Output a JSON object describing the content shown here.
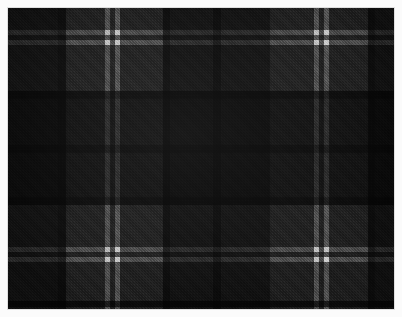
{
  "swatch": {
    "title": "Tartan fabric swatch",
    "description": "Grayscale tartan / plaid woven cloth with twill weave texture",
    "width": 402,
    "height": 317,
    "background_color": "#fbfbfb",
    "border_color": "#e8e8e8",
    "cloth": {
      "x": 8,
      "y": 8,
      "width": 386,
      "height": 301,
      "base_color": "#4a4a4a"
    },
    "palette": {
      "white": "#e9e9e9",
      "light_gray": "#c9c9c9",
      "mid_gray": "#595959",
      "gray": "#4d4d4d",
      "dark_gray": "#343434",
      "charcoal": "#202020",
      "near_black": "#0a0a0a",
      "black": "#000000"
    },
    "weave": {
      "type": "twill",
      "angle_deg": 45,
      "thread_px": 2
    },
    "warp_stripes": [
      {
        "name": "warp-black-left",
        "x": 0,
        "width": 50,
        "color": "#2a2a2a"
      },
      {
        "name": "warp-charcoal-1",
        "x": 50,
        "width": 8,
        "color": "#1e1e1e"
      },
      {
        "name": "warp-gray-1",
        "x": 58,
        "width": 39,
        "color": "#555555"
      },
      {
        "name": "warp-white-1",
        "x": 97,
        "width": 5,
        "color": "#d8d8d8"
      },
      {
        "name": "warp-gray-gap-1",
        "x": 102,
        "width": 5,
        "color": "#555555"
      },
      {
        "name": "warp-white-2",
        "x": 107,
        "width": 5,
        "color": "#e0e0e0"
      },
      {
        "name": "warp-gray-2",
        "x": 112,
        "width": 43,
        "color": "#555555"
      },
      {
        "name": "warp-charcoal-2",
        "x": 155,
        "width": 7,
        "color": "#1e1e1e"
      },
      {
        "name": "warp-dark-block-1",
        "x": 162,
        "width": 43,
        "color": "#2e2e2e"
      },
      {
        "name": "warp-charcoal-3",
        "x": 205,
        "width": 8,
        "color": "#1c1c1c"
      },
      {
        "name": "warp-dark-block-2",
        "x": 213,
        "width": 49,
        "color": "#2e2e2e"
      },
      {
        "name": "warp-gray-3",
        "x": 262,
        "width": 44,
        "color": "#555555"
      },
      {
        "name": "warp-white-3",
        "x": 306,
        "width": 5,
        "color": "#dcdcdc"
      },
      {
        "name": "warp-gray-gap-2",
        "x": 311,
        "width": 5,
        "color": "#555555"
      },
      {
        "name": "warp-white-4",
        "x": 316,
        "width": 5,
        "color": "#e4e4e4"
      },
      {
        "name": "warp-gray-4",
        "x": 321,
        "width": 39,
        "color": "#555555"
      },
      {
        "name": "warp-charcoal-4",
        "x": 360,
        "width": 7,
        "color": "#1e1e1e"
      },
      {
        "name": "warp-black-right",
        "x": 367,
        "width": 19,
        "color": "#2a2a2a"
      }
    ],
    "weft_stripes": [
      {
        "name": "weft-gray-top",
        "y": 0,
        "height": 22,
        "color": "#5a5a5a"
      },
      {
        "name": "weft-white-1",
        "y": 22,
        "height": 5,
        "color": "#d8d8d8"
      },
      {
        "name": "weft-gray-gap-1",
        "y": 27,
        "height": 5,
        "color": "#5a5a5a"
      },
      {
        "name": "weft-white-2",
        "y": 32,
        "height": 5,
        "color": "#e0e0e0"
      },
      {
        "name": "weft-gray-1",
        "y": 37,
        "height": 46,
        "color": "#5a5a5a"
      },
      {
        "name": "weft-charcoal-1",
        "y": 83,
        "height": 8,
        "color": "#1e1e1e"
      },
      {
        "name": "weft-dark-block-1",
        "y": 91,
        "height": 46,
        "color": "#2e2e2e"
      },
      {
        "name": "weft-charcoal-2",
        "y": 137,
        "height": 8,
        "color": "#1c1c1c"
      },
      {
        "name": "weft-dark-block-2",
        "y": 145,
        "height": 44,
        "color": "#2e2e2e"
      },
      {
        "name": "weft-charcoal-3",
        "y": 189,
        "height": 8,
        "color": "#1e1e1e"
      },
      {
        "name": "weft-gray-2",
        "y": 197,
        "height": 42,
        "color": "#5a5a5a"
      },
      {
        "name": "weft-white-3",
        "y": 239,
        "height": 5,
        "color": "#dcdcdc"
      },
      {
        "name": "weft-gray-gap-2",
        "y": 244,
        "height": 5,
        "color": "#5a5a5a"
      },
      {
        "name": "weft-white-4",
        "y": 249,
        "height": 5,
        "color": "#e4e4e4"
      },
      {
        "name": "weft-gray-3",
        "y": 254,
        "height": 39,
        "color": "#5a5a5a"
      },
      {
        "name": "weft-charcoal-4",
        "y": 293,
        "height": 6,
        "color": "#1e1e1e"
      },
      {
        "name": "weft-gray-bottom",
        "y": 299,
        "height": 2,
        "color": "#5a5a5a"
      }
    ]
  }
}
